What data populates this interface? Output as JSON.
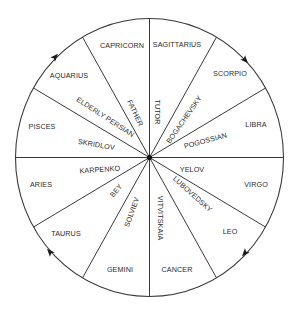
{
  "diagram": {
    "type": "zodiac-wheel",
    "direction": "clockwise",
    "colors": {
      "line": "#3a3a3a",
      "text": "#2b2b2b",
      "background": "#ffffff"
    },
    "signs": [
      {
        "name": "CAPRICORN"
      },
      {
        "name": "SAGITTARIUS"
      },
      {
        "name": "SCORPIO"
      },
      {
        "name": "LIBRA"
      },
      {
        "name": "VIRGO"
      },
      {
        "name": "LEO"
      },
      {
        "name": "CANCER"
      },
      {
        "name": "GEMINI"
      },
      {
        "name": "TAURUS"
      },
      {
        "name": "ARIES"
      },
      {
        "name": "PISCES"
      },
      {
        "name": "AQUARIUS"
      }
    ],
    "people": [
      {
        "name": "FATHER"
      },
      {
        "name": "TUTOR"
      },
      {
        "name": "BOGACHEVSKY"
      },
      {
        "name": "POGOSSIAN"
      },
      {
        "name": "YELOV"
      },
      {
        "name": "LUBOVEDSKY"
      },
      {
        "name": "VITVITSKAIA"
      },
      {
        "name": "SOLVIEV"
      },
      {
        "name": "BEY"
      },
      {
        "name": "KARPENKO"
      },
      {
        "name": "SKRIDLOV"
      },
      {
        "name": "ELDERLY PERSIAN"
      }
    ],
    "arrows": [
      {
        "position": "upper-left",
        "points": "clockwise"
      },
      {
        "position": "upper-right",
        "points": "clockwise"
      },
      {
        "position": "lower-right",
        "points": "clockwise"
      },
      {
        "position": "lower-left",
        "points": "clockwise"
      }
    ]
  }
}
